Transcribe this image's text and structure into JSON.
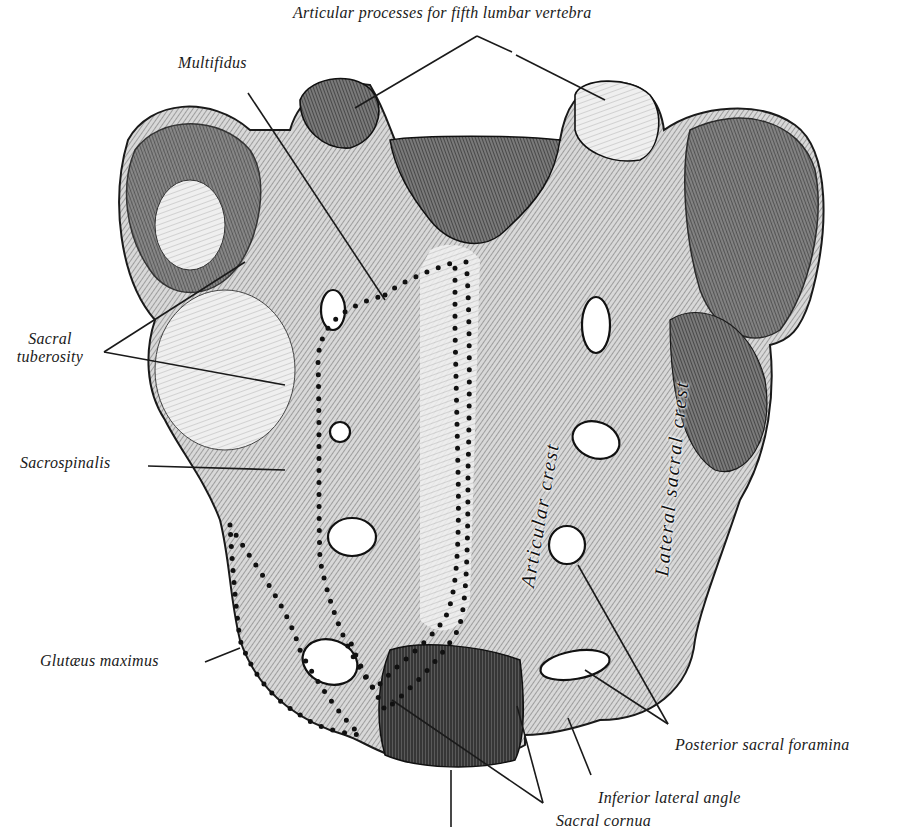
{
  "figure": {
    "ink_color": "#1a1a1a",
    "paper_color": "#ffffff",
    "bone_light": "#e9e9e9",
    "bone_mid": "#9a9a9a",
    "bone_dark": "#3a3a3a"
  },
  "labels": {
    "articular_processes": "Articular processes for fifth lumbar vertebra",
    "multifidus": "Multifidus",
    "sacral_tuberosity_line1": "Sacral",
    "sacral_tuberosity_line2": "tuberosity",
    "sacrospinalis": "Sacrospinalis",
    "glutaeus_maximus": "Glutæus maximus",
    "posterior_sacral_foramina": "Posterior sacral foramina",
    "inferior_lateral_angle": "Inferior lateral angle",
    "sacral_cornua": "Sacral cornua",
    "articular_crest": "Articular crest",
    "lateral_sacral_crest": "Lateral sacral crest"
  }
}
